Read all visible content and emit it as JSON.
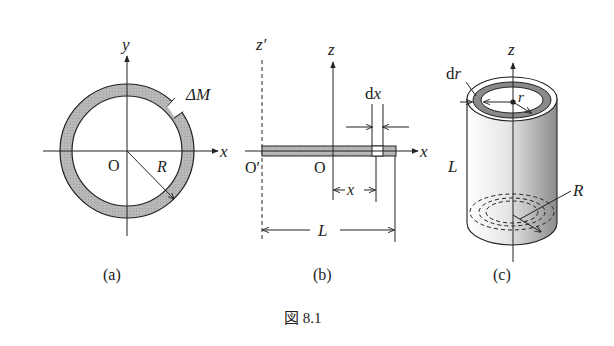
{
  "figure": {
    "caption": "図 8.1",
    "panels": {
      "a": {
        "label": "(a)",
        "axis_x": "x",
        "axis_y": "y",
        "origin": "O",
        "radius": "R",
        "mass_element": "ΔM"
      },
      "b": {
        "label": "(b)",
        "axis_z": "z",
        "axis_z_prime": "z′",
        "axis_x": "x",
        "origin": "O",
        "origin_prime": "O′",
        "element_width": "dx",
        "position": "x",
        "length": "L"
      },
      "c": {
        "label": "(c)",
        "axis_z": "z",
        "shell_thickness": "dr",
        "shell_radius": "r",
        "length": "L",
        "radius": "R"
      }
    },
    "colors": {
      "ring_fill": "#b5b5b5",
      "line": "#222222",
      "shell_fill": "#8a8a8a"
    }
  }
}
